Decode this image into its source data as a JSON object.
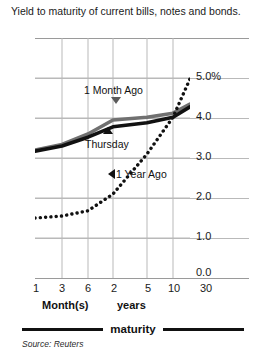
{
  "chart_data": {
    "type": "line",
    "title": "Yield to maturity of current bills, notes and bonds.",
    "xlabel": "maturity",
    "ylabel": "",
    "ylim": [
      0.0,
      6.0
    ],
    "grid": true,
    "legend_position": "bottom",
    "source": "Source: Reuters",
    "categories": [
      "1",
      "3",
      "6",
      "2",
      "5",
      "10",
      "30"
    ],
    "x_group_labels": [
      "Month(s)",
      "years"
    ],
    "x_tick_labels": [
      "1",
      "3",
      "6",
      "2",
      "5",
      "10",
      "30"
    ],
    "y_tick_labels": [
      "5.0%",
      "4.0",
      "3.0",
      "2.0",
      "1.0",
      "0.0"
    ],
    "y_tick_values": [
      5.0,
      4.0,
      3.0,
      2.0,
      1.0,
      0.0
    ],
    "series": [
      {
        "name": "Thursday",
        "style": "solid",
        "color": "#111111",
        "values": [
          3.17,
          3.3,
          3.52,
          3.78,
          3.88,
          4.02,
          4.28
        ]
      },
      {
        "name": "1 Month Ago",
        "style": "solid",
        "color": "#707070",
        "values": [
          3.2,
          3.34,
          3.6,
          3.95,
          4.02,
          4.12,
          4.35
        ]
      },
      {
        "name": "1 Year Ago",
        "style": "dotted",
        "color": "#111111",
        "values": [
          1.5,
          1.55,
          1.68,
          2.1,
          3.1,
          4.02,
          4.98
        ]
      }
    ],
    "annotations": [
      {
        "label": "1 Month Ago",
        "marker": "triangle-down"
      },
      {
        "label": "Thursday",
        "marker": "triangle-up"
      },
      {
        "label": "1 Year Ago",
        "marker": "triangle-left"
      }
    ]
  },
  "legend": {
    "label": "maturity"
  }
}
